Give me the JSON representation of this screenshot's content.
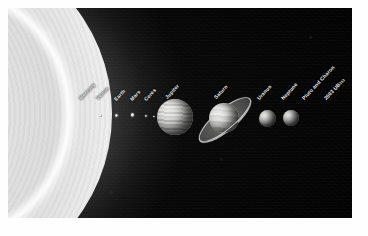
{
  "scene": {
    "title": "Solar System size comparison",
    "background_color": "#050506",
    "frame_color": "#ffffff",
    "label_color": "#f2f2f0"
  },
  "sun": {
    "name": "Sun",
    "description": "granulated solar limb at left edge",
    "color": "#f4f4f4"
  },
  "bodies": [
    {
      "label": "Mercury",
      "kind": "dot",
      "x": 100.5,
      "y": 115.5,
      "size": 2.2
    },
    {
      "label": "Venus",
      "kind": "dot",
      "x": 116.0,
      "y": 115.0,
      "size": 3.0
    },
    {
      "label": "Earth",
      "kind": "dot",
      "x": 132.5,
      "y": 115.0,
      "size": 3.2
    },
    {
      "label": "Mars",
      "kind": "dot",
      "x": 146.0,
      "y": 116.0,
      "size": 2.0
    },
    {
      "label": "Ceres",
      "kind": "dot",
      "x": 154.0,
      "y": 116.5,
      "size": 1.2
    },
    {
      "label": "Jupiter",
      "kind": "jupiter",
      "x": 174.5,
      "y": 116.5,
      "size": 36.0
    },
    {
      "label": "Saturn",
      "kind": "saturn",
      "x": 223.5,
      "y": 118.0,
      "size": 30.0
    },
    {
      "label": "Uranus",
      "kind": "ice",
      "x": 267.5,
      "y": 118.0,
      "size": 17.0
    },
    {
      "label": "Neptune",
      "kind": "ice",
      "x": 291.0,
      "y": 118.0,
      "size": 16.0
    },
    {
      "label": "Pluto and Charon",
      "kind": "none",
      "x": 312.0,
      "y": 118.0,
      "size": 1.0
    },
    {
      "label": "2003 UB313",
      "kind": "none",
      "x": 330.0,
      "y": 118.0,
      "size": 1.2,
      "label_main": "2003 UB",
      "label_sub": "313"
    }
  ],
  "labels": [
    {
      "text": "Mercury",
      "x": 82,
      "y": 95
    },
    {
      "text": "Venus",
      "x": 99,
      "y": 95
    },
    {
      "text": "Earth",
      "x": 117,
      "y": 96
    },
    {
      "text": "Mars",
      "x": 133,
      "y": 96
    },
    {
      "text": "Ceres",
      "x": 147,
      "y": 96
    },
    {
      "text": "Jupiter",
      "x": 168,
      "y": 94
    },
    {
      "text": "Saturn",
      "x": 217,
      "y": 94
    },
    {
      "text": "Uranus",
      "x": 260,
      "y": 95
    },
    {
      "text": "Neptune",
      "x": 284,
      "y": 95
    },
    {
      "text": "Pluto and Charon",
      "x": 305,
      "y": 95
    },
    {
      "text": "2003 UB313",
      "x": 327,
      "y": 95,
      "main": "2003 UB",
      "sub": "313"
    }
  ]
}
